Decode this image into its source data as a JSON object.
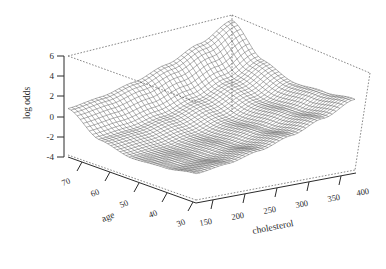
{
  "figure": {
    "type": "3d-surface-wireframe",
    "background": "#ffffff",
    "line_color": "#3a3a3a",
    "box_style": "dashed"
  },
  "axes": {
    "z": {
      "title": "log odds",
      "ticks": [
        "6",
        "4",
        "2",
        "0",
        "-2",
        "-4"
      ],
      "range": [
        -4,
        6
      ]
    },
    "x": {
      "title": "age",
      "ticks": [
        "70",
        "60",
        "50",
        "40",
        "30"
      ],
      "range": [
        30,
        70
      ],
      "direction": "descending-left-to-right"
    },
    "y": {
      "title": "cholesterol",
      "ticks": [
        "150",
        "200",
        "250",
        "300",
        "350",
        "400"
      ],
      "range": [
        150,
        400
      ],
      "direction": "ascending-left-to-right"
    }
  },
  "chart_data": {
    "type": "surface",
    "title": "",
    "xlabel": "age",
    "ylabel": "cholesterol",
    "zlabel": "log odds",
    "xlim": [
      30,
      70
    ],
    "ylim": [
      150,
      400
    ],
    "zlim": [
      -4,
      6
    ],
    "grid": true,
    "legend": "none",
    "x": [
      30,
      40,
      50,
      60,
      70
    ],
    "y": [
      150,
      200,
      250,
      300,
      350,
      400
    ],
    "z_matrix": [
      [
        -1.4,
        -1.0,
        -0.3,
        0.6,
        1.7,
        3.0
      ],
      [
        -1.9,
        -1.6,
        -1.0,
        -0.1,
        1.0,
        2.3
      ],
      [
        -2.1,
        -1.9,
        -1.4,
        -0.6,
        0.5,
        1.8
      ],
      [
        -1.4,
        -1.2,
        -0.7,
        0.1,
        1.2,
        2.6
      ],
      [
        0.6,
        0.9,
        1.5,
        2.4,
        3.6,
        5.1
      ]
    ],
    "z_note": "rows are age 30..70, columns are cholesterol 150..400; saddle surface low in mid-age mid-cholesterol, rising steeply at age 70 and at cholesterol 400"
  }
}
